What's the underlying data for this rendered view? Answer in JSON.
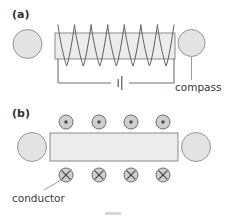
{
  "figure": {
    "width": 226,
    "height": 220,
    "background": "#ffffff"
  },
  "colors": {
    "core_fill": "#ececec",
    "core_stroke": "#8a8a8a",
    "circle_fill": "#e3e3e3",
    "circle_stroke": "#949494",
    "wire_stroke": "#6f6f6f",
    "coil_stroke": "#5e5e5e",
    "symbol_fill": "#cfcfcf",
    "symbol_stroke": "#6b6b6b",
    "symbol_mark": "#4a4a4a",
    "leader_stroke": "#9a9a9a",
    "text": "#3a3a3a",
    "label_text": "#2f2f2f",
    "artifact": "#d6d6d6"
  },
  "panel_a": {
    "label": "(a)",
    "label_x": 12,
    "label_y": 18,
    "left_circle": {
      "name": "magnet-pole-left",
      "cx": 27.5,
      "cy": 44,
      "r": 14.5
    },
    "right_circle": {
      "name": "compass",
      "cx": 191.5,
      "cy": 43,
      "r": 13.5
    },
    "core_bar": {
      "x": 55,
      "y": 33,
      "width": 120,
      "height": 26
    },
    "coil": {
      "turns": 7,
      "x_start": 58,
      "x_end": 174,
      "top_y": 25,
      "bottom_y": 66,
      "mid_top_y": 33,
      "mid_bottom_y": 59
    },
    "circuit": {
      "left_x": 58,
      "right_x": 174,
      "wire_top_left_y": 59,
      "wire_top_right_y": 59,
      "bottom_y": 83
    },
    "battery": {
      "name": "battery-symbol",
      "center_x": 120,
      "long_plate_half_height": 7,
      "short_plate_half_height": 4,
      "plate_gap": 3.5
    },
    "compass_leader": {
      "x": 191.5,
      "y_top": 57,
      "y_bottom": 80
    },
    "compass_label": {
      "text": "compass",
      "x": 175,
      "y": 91,
      "anchor": "start"
    }
  },
  "panel_b": {
    "label": "(b)",
    "label_x": 12,
    "label_y": 117,
    "left_circle": {
      "name": "magnet-pole-left",
      "cx": 32,
      "cy": 147,
      "r": 14.5
    },
    "right_circle": {
      "name": "magnet-pole-right",
      "cx": 196,
      "cy": 147,
      "r": 14.5
    },
    "core_bar": {
      "x": 50,
      "y": 133,
      "width": 128,
      "height": 28
    },
    "field_out_symbols": {
      "name": "field-out-of-page",
      "glyph": "dot",
      "count": 4,
      "r": 7,
      "cy": 122,
      "cx_positions": [
        66,
        99,
        131,
        163
      ]
    },
    "field_in_symbols": {
      "name": "field-into-page",
      "glyph": "cross",
      "count": 4,
      "r": 7,
      "cy": 175,
      "cx_positions": [
        66,
        99,
        131,
        163
      ]
    },
    "conductor_leader": {
      "x1": 44,
      "y1": 190,
      "x2": 61,
      "y2": 180
    },
    "conductor_label": {
      "text": "conductor",
      "x": 12,
      "y": 202,
      "anchor": "start"
    }
  },
  "artifact": {
    "x": 105,
    "y": 212,
    "width": 16,
    "height": 3
  }
}
